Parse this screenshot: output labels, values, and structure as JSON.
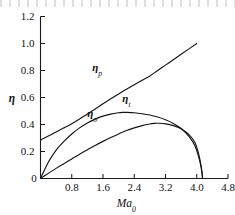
{
  "chart_data": {
    "type": "line",
    "title": "",
    "xlabel": "Ma₀",
    "xlabel_main": "Ma",
    "xlabel_sub": "0",
    "ylabel": "η",
    "xlim": [
      0,
      4.8
    ],
    "ylim": [
      0,
      1.2
    ],
    "grid": false,
    "legend": "inline-curve-labels",
    "xticks": [
      "0",
      "0.8",
      "1.6",
      "2.4",
      "3.2",
      "4.0",
      "4.8"
    ],
    "xtick_values": [
      0,
      0.8,
      1.6,
      2.4,
      3.2,
      4.0,
      4.8
    ],
    "yticks": [
      "0",
      "0.2",
      "0.4",
      "0.6",
      "0.8",
      "1.0",
      "1.2"
    ],
    "ytick_values": [
      0,
      0.2,
      0.4,
      0.6,
      0.8,
      1.0,
      1.2
    ],
    "series": [
      {
        "name": "ηp",
        "label_main": "η",
        "label_sub": "p",
        "label_x": 1.45,
        "label_y": 0.8,
        "x": [
          0.0,
          0.2,
          0.4,
          0.6,
          0.8,
          1.0,
          1.2,
          1.4,
          1.6,
          1.8,
          2.0,
          2.2,
          2.4,
          2.6,
          2.8,
          3.0,
          3.2,
          3.4,
          3.6,
          3.8,
          4.0
        ],
        "values": [
          0.285,
          0.315,
          0.345,
          0.375,
          0.405,
          0.44,
          0.478,
          0.515,
          0.553,
          0.59,
          0.626,
          0.661,
          0.695,
          0.728,
          0.76,
          0.8,
          0.84,
          0.88,
          0.92,
          0.96,
          1.0
        ]
      },
      {
        "name": "ηt",
        "label_main": "η",
        "label_sub": "t",
        "label_x": 2.2,
        "label_y": 0.565,
        "x": [
          0.0,
          0.2,
          0.4,
          0.6,
          0.8,
          1.0,
          1.2,
          1.4,
          1.6,
          1.8,
          2.0,
          2.1,
          2.2,
          2.4,
          2.6,
          2.8,
          3.0,
          3.2,
          3.4,
          3.6,
          3.8,
          3.95,
          4.05,
          4.12,
          4.15
        ],
        "values": [
          0.0,
          0.12,
          0.21,
          0.275,
          0.33,
          0.375,
          0.412,
          0.44,
          0.462,
          0.477,
          0.487,
          0.49,
          0.49,
          0.487,
          0.48,
          0.47,
          0.455,
          0.435,
          0.408,
          0.37,
          0.312,
          0.245,
          0.16,
          0.07,
          0.0
        ]
      },
      {
        "name": "ηo",
        "label_main": "η",
        "label_sub": "o",
        "label_x": 1.32,
        "label_y": 0.455,
        "x": [
          0.0,
          0.2,
          0.4,
          0.6,
          0.8,
          1.0,
          1.2,
          1.4,
          1.6,
          1.8,
          2.0,
          2.2,
          2.4,
          2.6,
          2.8,
          2.9,
          3.0,
          3.2,
          3.4,
          3.6,
          3.8,
          3.95,
          4.05,
          4.12,
          4.15
        ],
        "values": [
          0.0,
          0.038,
          0.075,
          0.11,
          0.145,
          0.18,
          0.213,
          0.245,
          0.275,
          0.303,
          0.33,
          0.355,
          0.375,
          0.392,
          0.404,
          0.408,
          0.409,
          0.405,
          0.392,
          0.368,
          0.325,
          0.268,
          0.18,
          0.078,
          0.0
        ]
      }
    ]
  },
  "colors": {
    "curve": "#141414",
    "axis": "#1a1a1a",
    "background": "#ffffff"
  }
}
